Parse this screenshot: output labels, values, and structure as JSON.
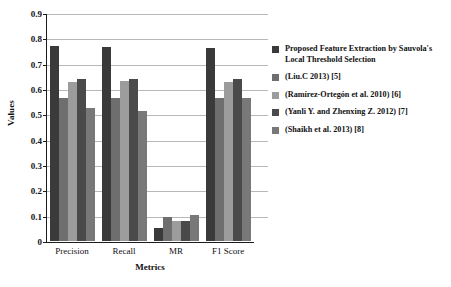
{
  "chart_data": {
    "type": "bar",
    "title": "",
    "xlabel": "Metrics",
    "ylabel": "Values",
    "categories": [
      "Precision",
      "Recall",
      "MR",
      "F1 Score"
    ],
    "ylim": [
      0,
      0.9
    ],
    "ytick_labels": [
      "0",
      "0.1",
      "0.2",
      "0.3",
      "0.4",
      "0.5",
      "0.6",
      "0.7",
      "0.8",
      "0.9"
    ],
    "ytick_values": [
      0,
      0.1,
      0.2,
      0.3,
      0.4,
      0.5,
      0.6,
      0.7,
      0.8,
      0.9
    ],
    "grid": true,
    "legend_position": "right",
    "series": [
      {
        "name": "Proposed Feature Extraction by Sauvola's Local Threshold Selection",
        "color": "#3a3a3a",
        "values": [
          0.771,
          0.764,
          0.052,
          0.76
        ]
      },
      {
        "name": "(Liu.C 2013) [5]",
        "color": "#6e6e6e",
        "values": [
          0.563,
          0.564,
          0.095,
          0.565
        ]
      },
      {
        "name": "(Ramírez-Ortegón et al. 2010) [6]",
        "color": "#9c9c9c",
        "values": [
          0.627,
          0.631,
          0.079,
          0.626
        ]
      },
      {
        "name": "(Yanli Y. and Zhenxing Z. 2012) [7]",
        "color": "#4a4a4a",
        "values": [
          0.641,
          0.639,
          0.078,
          0.64
        ]
      },
      {
        "name": "(Shaikh et al. 2013) [8]",
        "color": "#787878",
        "values": [
          0.524,
          0.514,
          0.103,
          0.565
        ]
      }
    ]
  },
  "legend": {
    "items": [
      {
        "label": "Proposed Feature Extraction by Sauvola's Local Threshold Selection",
        "color": "#3a3a3a"
      },
      {
        "label": "(Liu.C 2013) [5]",
        "color": "#6e6e6e"
      },
      {
        "label": "(Ramírez-Ortegón et al. 2010) [6]",
        "color": "#9c9c9c"
      },
      {
        "label": "(Yanli Y. and Zhenxing Z. 2012) [7]",
        "color": "#4a4a4a"
      },
      {
        "label": "(Shaikh et al. 2013) [8]",
        "color": "#787878"
      }
    ]
  }
}
